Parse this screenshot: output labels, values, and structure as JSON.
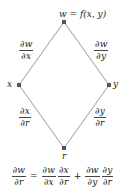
{
  "diagram": {
    "type": "tree-diagram",
    "colors": {
      "edge": "#9a9a9a",
      "node": "#555555",
      "text": "#222222"
    },
    "nodes": [
      {
        "id": "w",
        "label": "w = f(x, y)",
        "x": 64,
        "y": 22
      },
      {
        "id": "x",
        "label": "x",
        "x": 19,
        "y": 85
      },
      {
        "id": "y",
        "label": "y",
        "x": 109,
        "y": 85
      },
      {
        "id": "r",
        "label": "r",
        "x": 64,
        "y": 148
      }
    ],
    "edges": [
      {
        "from": "w",
        "to": "x",
        "label": {
          "num": "∂w",
          "den": "∂x"
        }
      },
      {
        "from": "w",
        "to": "y",
        "label": {
          "num": "∂w",
          "den": "∂y"
        }
      },
      {
        "from": "x",
        "to": "r",
        "label": {
          "num": "∂x",
          "den": "∂r"
        }
      },
      {
        "from": "y",
        "to": "r",
        "label": {
          "num": "∂y",
          "den": "∂r"
        }
      }
    ],
    "formula": {
      "lhs": {
        "num": "∂w",
        "den": "∂r"
      },
      "eq": "=",
      "term1": [
        {
          "num": "∂w",
          "den": "∂x"
        },
        {
          "num": "∂x",
          "den": "∂r"
        }
      ],
      "plus": "+",
      "term2": [
        {
          "num": "∂w",
          "den": "∂y"
        },
        {
          "num": "∂y",
          "den": "∂r"
        }
      ]
    }
  }
}
